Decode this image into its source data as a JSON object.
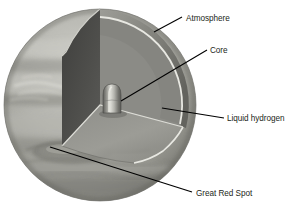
{
  "figure": {
    "background_color": "#ffffff"
  },
  "labels": [
    {
      "id": "atmosphere",
      "text": "Atmosphere",
      "text_x": 186,
      "text_y": 21,
      "leader_from_x": 154,
      "leader_from_y": 32,
      "leader_to_x": 182,
      "leader_to_y": 17
    },
    {
      "id": "core",
      "text": "Core",
      "text_x": 210,
      "text_y": 53,
      "leader_from_x": 121,
      "leader_from_y": 101,
      "leader_to_x": 207,
      "leader_to_y": 50
    },
    {
      "id": "liquid-hydrogen",
      "text": "Liquid hydrogen",
      "text_x": 227,
      "text_y": 121,
      "leader_from_x": 162,
      "leader_from_y": 108,
      "leader_to_x": 224,
      "leader_to_y": 118
    },
    {
      "id": "great-red-spot",
      "text": "Great Red Spot",
      "text_x": 196,
      "text_y": 196,
      "leader_from_x": 50,
      "leader_from_y": 147,
      "leader_to_x": 192,
      "leader_to_y": 192
    }
  ],
  "planet": {
    "name": "Jupiter",
    "center_x": 100,
    "center_y": 105,
    "radius": 96,
    "colors": {
      "surface_light": "#bfbfbb",
      "surface_mid": "#a3a39e",
      "surface_dark": "#8a8a85",
      "band_dark": "#7b7b76",
      "band_light": "#cfcfc9",
      "cutaway_dark_face": "#4e4e4b",
      "cutaway_mid_face": "#6f6f6b",
      "mantle_fill": "#9a9a95",
      "mantle_floor": "#8f8f8a",
      "rim_highlight": "#e4e4de",
      "core_light": "#d8d8d2",
      "core_dark": "#6a6a66",
      "leader_line": "#000000",
      "outline": "#6e6e69"
    }
  },
  "features": {
    "great_red_spot_label": "Great Red Spot",
    "core_label": "Core",
    "atmosphere_label": "Atmosphere",
    "liquid_hydrogen_label": "Liquid hydrogen"
  }
}
